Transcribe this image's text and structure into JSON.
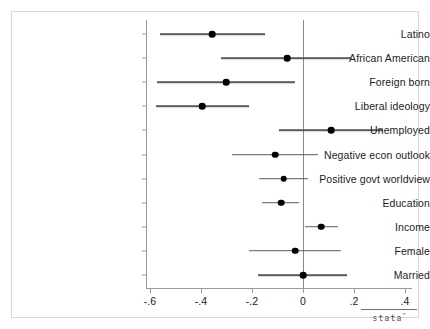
{
  "chart_data": {
    "type": "scatter",
    "title": "",
    "subtitle": "",
    "xlabel": "",
    "ylabel": "",
    "xlim": [
      -0.68,
      0.44
    ],
    "xticks": [
      -0.6,
      -0.4,
      -0.2,
      0,
      0.2,
      0.4
    ],
    "xtick_labels": [
      "-.6",
      "-.4",
      "-.2",
      "0",
      ".2",
      ".4"
    ],
    "grid": false,
    "legend": null,
    "reference_line": 0,
    "orientation": "horizontal",
    "marker": "filled-circle",
    "categories": [
      "Latino",
      "African American",
      "Foreign born",
      "Liberal ideology",
      "Unemployed",
      "Negative econ outlook",
      "Positive govt worldview",
      "Education",
      "Income",
      "Female",
      "Married"
    ],
    "series": [
      {
        "name": "Coefficient estimate",
        "values": [
          -0.357,
          -0.063,
          -0.302,
          -0.396,
          0.11,
          -0.11,
          -0.075,
          -0.086,
          0.071,
          -0.031,
          0.0
        ],
        "ci_low": [
          -0.561,
          -0.322,
          -0.573,
          -0.577,
          -0.094,
          -0.279,
          -0.173,
          -0.161,
          0.008,
          -0.212,
          -0.177
        ],
        "ci_high": [
          -0.149,
          0.188,
          -0.031,
          -0.212,
          0.314,
          0.059,
          0.02,
          -0.016,
          0.137,
          0.149,
          0.173
        ]
      }
    ],
    "points": [
      {
        "label": "Latino",
        "estimate": -0.357,
        "ci_low": -0.561,
        "ci_high": -0.149
      },
      {
        "label": "African American",
        "estimate": -0.063,
        "ci_low": -0.322,
        "ci_high": 0.188
      },
      {
        "label": "Foreign born",
        "estimate": -0.302,
        "ci_low": -0.573,
        "ci_high": -0.031
      },
      {
        "label": "Liberal ideology",
        "estimate": -0.396,
        "ci_low": -0.577,
        "ci_high": -0.212
      },
      {
        "label": "Unemployed",
        "estimate": 0.11,
        "ci_low": -0.094,
        "ci_high": 0.314
      },
      {
        "label": "Negative econ outlook",
        "estimate": -0.11,
        "ci_low": -0.279,
        "ci_high": 0.059
      },
      {
        "label": "Positive govt worldview",
        "estimate": -0.075,
        "ci_low": -0.173,
        "ci_high": 0.02
      },
      {
        "label": "Education",
        "estimate": -0.086,
        "ci_low": -0.161,
        "ci_high": -0.016
      },
      {
        "label": "Income",
        "estimate": 0.071,
        "ci_low": 0.008,
        "ci_high": 0.137
      },
      {
        "label": "Female",
        "estimate": -0.031,
        "ci_low": -0.212,
        "ci_high": 0.149
      },
      {
        "label": "Married",
        "estimate": 0.0,
        "ci_low": -0.177,
        "ci_high": 0.173
      }
    ]
  },
  "watermark": {
    "wordmark": "stata",
    "trademark": "™"
  },
  "colors": {
    "marker": "#000000",
    "ci_line": "#5a5a5a",
    "axis": "#9a9a9a",
    "zero_line": "#8a8a8a",
    "frame": "#d8d8d8",
    "background": "#ffffff",
    "text": "#1c1c1c"
  }
}
